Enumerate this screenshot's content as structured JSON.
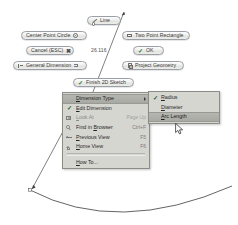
{
  "app": {
    "title": "Autodesk Inventor 2D Sketch",
    "background": "#ffffff"
  },
  "colors": {
    "menu_bg": "#d6d6d1",
    "menu_border": "#8d8d88",
    "highlight": "#b6b6b0",
    "check_green": "#2f7d32",
    "disabled_text": "#8a8a86",
    "accel_text": "#7b7b78",
    "geometry_stroke": "#3c3c3c"
  },
  "marking_menu": {
    "buttons": [
      {
        "id": "line",
        "label": "Line",
        "icon": "line-icon",
        "icon_side": "left",
        "x": 87,
        "y": 16,
        "width": 34
      },
      {
        "id": "center-point-circle",
        "label": "Center Point Circle",
        "icon": "circle-icon",
        "icon_side": "right",
        "x": 21,
        "y": 31,
        "width": 66
      },
      {
        "id": "two-point-rectangle",
        "label": "Two Point Rectangle",
        "icon": "rectangle-icon",
        "icon_side": "left",
        "x": 122,
        "y": 31,
        "width": 68
      },
      {
        "id": "cancel-esc",
        "label": "Cancel (ESC)",
        "icon": "close-icon",
        "icon_side": "right",
        "x": 26,
        "y": 46,
        "width": 48
      },
      {
        "id": "ok",
        "label": "OK",
        "icon": "checkmark-icon",
        "icon_side": "left",
        "x": 133,
        "y": 46,
        "width": 31
      },
      {
        "id": "general-dimension",
        "label": "General Dimension",
        "icon": "dimension-icon",
        "icon_side": "both",
        "x": 13,
        "y": 61,
        "width": 74
      },
      {
        "id": "project-geometry",
        "label": "Project Geometry",
        "icon": "project-icon",
        "icon_side": "left",
        "x": 122,
        "y": 61,
        "width": 62
      },
      {
        "id": "finish-2d-sketch",
        "label": "Finish 2D Sketch",
        "icon": "checkmark-icon",
        "icon_side": "left",
        "x": 73,
        "y": 78,
        "width": 61
      }
    ]
  },
  "sketch": {
    "dimension_value": "26.116",
    "dimension_value_x": 91,
    "dimension_value_y": 47
  },
  "context_menu": {
    "items": [
      {
        "id": "dimension-type",
        "label": "Dimension Type",
        "underline": "D",
        "accel": "",
        "icon": "",
        "checked": false,
        "submenu": true,
        "highlighted": true,
        "disabled": false
      },
      {
        "id": "edit-dimension",
        "label": "Edit Dimension",
        "underline": "E",
        "accel": "",
        "icon": "",
        "checked": true,
        "submenu": false,
        "highlighted": false,
        "disabled": false
      },
      {
        "id": "look-at",
        "label": "Look At",
        "underline": "L",
        "accel": "Page Up",
        "icon": "lookat-icon",
        "checked": false,
        "submenu": false,
        "highlighted": false,
        "disabled": true
      },
      {
        "id": "find-in-browser",
        "label": "Find in Browser",
        "underline": "B",
        "accel": "Ctrl+F",
        "icon": "find-icon",
        "checked": false,
        "submenu": false,
        "highlighted": false,
        "disabled": false
      },
      {
        "id": "previous-view",
        "label": "Previous View",
        "underline": "P",
        "accel": "F5",
        "icon": "prev-icon",
        "checked": false,
        "submenu": false,
        "highlighted": false,
        "disabled": false
      },
      {
        "id": "home-view",
        "label": "Home View",
        "underline": "H",
        "accel": "F6",
        "icon": "home-icon",
        "checked": false,
        "submenu": false,
        "highlighted": false,
        "disabled": false
      },
      {
        "id": "how-to",
        "label": "How To...",
        "underline": "H",
        "accel": "",
        "icon": "",
        "checked": false,
        "submenu": false,
        "highlighted": false,
        "disabled": false
      }
    ]
  },
  "submenu": {
    "title": "Dimension Type",
    "items": [
      {
        "id": "radius",
        "label": "Radius",
        "underline": "R",
        "checked": true,
        "highlighted": false
      },
      {
        "id": "diameter",
        "label": "Diameter",
        "underline": "D",
        "checked": false,
        "highlighted": false
      },
      {
        "id": "arc-length",
        "label": "Arc Length",
        "underline": "A",
        "checked": false,
        "highlighted": true
      }
    ]
  },
  "cursor": {
    "x": 175,
    "y": 123,
    "type": "arrow-pointer"
  }
}
